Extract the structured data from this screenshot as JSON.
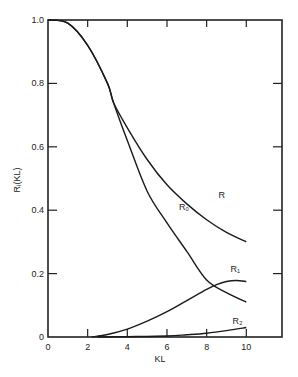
{
  "chart_data": {
    "type": "line",
    "title": "",
    "xlabel": "KL",
    "ylabel": "Rᵢ(KL)",
    "xlim": [
      0,
      11.8
    ],
    "ylim": [
      0,
      1.0
    ],
    "xticks": [
      "0",
      "2",
      "4",
      "6",
      "8",
      "10"
    ],
    "yticks": [
      "0",
      "0.2",
      "0.4",
      "0.6",
      "0.8",
      "1.0"
    ],
    "grid": false,
    "legend": "inline labels",
    "series": [
      {
        "name": "R",
        "label": "R",
        "x": [
          0,
          1,
          2,
          3,
          3.3,
          4,
          5,
          6,
          7,
          8,
          9,
          10
        ],
        "y": [
          1.0,
          0.99,
          0.92,
          0.8,
          0.74,
          0.66,
          0.56,
          0.48,
          0.42,
          0.37,
          0.33,
          0.3
        ]
      },
      {
        "name": "R0",
        "label": "R₀",
        "x": [
          0,
          1,
          2,
          3,
          3.3,
          4,
          5,
          6,
          7,
          8,
          9,
          10
        ],
        "y": [
          1.0,
          0.99,
          0.92,
          0.8,
          0.74,
          0.62,
          0.46,
          0.36,
          0.27,
          0.18,
          0.14,
          0.11
        ]
      },
      {
        "name": "R1",
        "label": "R₁",
        "x": [
          2.2,
          3,
          4,
          5,
          6,
          7,
          8,
          8.5,
          9,
          9.5,
          10
        ],
        "y": [
          0.0,
          0.008,
          0.025,
          0.05,
          0.08,
          0.115,
          0.15,
          0.165,
          0.175,
          0.178,
          0.175
        ]
      },
      {
        "name": "R2",
        "label": "R₂",
        "x": [
          2.5,
          4,
          6,
          7,
          8,
          9,
          10
        ],
        "y": [
          0.0,
          0.001,
          0.003,
          0.007,
          0.012,
          0.02,
          0.03
        ]
      }
    ],
    "annotations": [
      {
        "text": "R",
        "x": 8.6,
        "y": 0.44
      },
      {
        "text": "R₀",
        "x": 6.6,
        "y": 0.4
      },
      {
        "text": "R₁",
        "x": 9.2,
        "y": 0.205
      },
      {
        "text": "R₂",
        "x": 9.3,
        "y": 0.04
      }
    ]
  },
  "labels": {
    "xlabel": "KL",
    "ylabel": "Rᵢ(KL)",
    "curve_R": "R",
    "curve_R0": "R₀",
    "curve_R1": "R₁",
    "curve_R2": "R₂"
  }
}
